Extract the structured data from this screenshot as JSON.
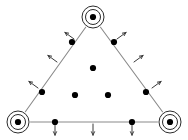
{
  "canvas": {
    "width": 188,
    "height": 140,
    "background": "#ffffff",
    "title": "Triangle lattice with corner orbifold points and outward boundary arrows"
  },
  "style": {
    "edge_color": "#8a8a8a",
    "edge_width": 1.1,
    "dot_color": "#000000",
    "dot_radius": 3.1,
    "ring_color": "#2b2b2b",
    "ring_width": 1.0,
    "arrow_color": "#3a3a3a",
    "arrow_width": 1.0,
    "arrow_length": 11
  },
  "chart_data": {
    "type": "scatter",
    "xlabel": "",
    "ylabel": "",
    "xlim": [
      0,
      188
    ],
    "ylim": [
      140,
      0
    ],
    "grid": false,
    "legend": "none",
    "series": [
      {
        "name": "corner-orbifold-points",
        "marker": "concentric-circles",
        "count": 3,
        "points": [
          {
            "label": "top-vertex",
            "x": 93,
            "y": 17
          },
          {
            "label": "bottom-left-vertex",
            "x": 18,
            "y": 122
          },
          {
            "label": "bottom-right-vertex",
            "x": 170,
            "y": 122
          }
        ]
      },
      {
        "name": "edge-points",
        "marker": "filled-dot",
        "count": 6,
        "points": [
          {
            "label": "left-edge-upper",
            "x": 72,
            "y": 42
          },
          {
            "label": "left-edge-lower",
            "x": 42,
            "y": 92
          },
          {
            "label": "right-edge-upper",
            "x": 114,
            "y": 42
          },
          {
            "label": "right-edge-lower",
            "x": 146,
            "y": 92
          },
          {
            "label": "bottom-edge-left",
            "x": 55,
            "y": 122
          },
          {
            "label": "bottom-edge-right",
            "x": 132,
            "y": 122
          }
        ]
      },
      {
        "name": "interior-points",
        "marker": "filled-dot",
        "count": 3,
        "points": [
          {
            "label": "interior-top",
            "x": 93,
            "y": 68
          },
          {
            "label": "interior-bottom-left",
            "x": 75,
            "y": 95
          },
          {
            "label": "interior-bottom-right",
            "x": 108,
            "y": 95
          }
        ]
      }
    ],
    "edges": [
      {
        "label": "left-edge",
        "x1": 93,
        "y1": 17,
        "x2": 18,
        "y2": 122
      },
      {
        "label": "right-edge",
        "x1": 93,
        "y1": 17,
        "x2": 170,
        "y2": 122
      },
      {
        "label": "bottom-edge",
        "x1": 18,
        "y1": 122,
        "x2": 170,
        "y2": 122
      }
    ],
    "arrows": [
      {
        "label": "left-edge-arrow-1",
        "x": 74,
        "y": 39,
        "dx": -0.81,
        "dy": -0.59
      },
      {
        "label": "left-edge-arrow-2",
        "x": 57,
        "y": 62,
        "dx": -0.81,
        "dy": -0.59
      },
      {
        "label": "left-edge-arrow-3",
        "x": 38,
        "y": 88,
        "dx": -0.81,
        "dy": -0.59
      },
      {
        "label": "right-edge-arrow-1",
        "x": 117,
        "y": 39,
        "dx": 0.81,
        "dy": -0.59
      },
      {
        "label": "right-edge-arrow-2",
        "x": 134,
        "y": 62,
        "dx": 0.81,
        "dy": -0.59
      },
      {
        "label": "right-edge-arrow-3",
        "x": 152,
        "y": 88,
        "dx": 0.81,
        "dy": -0.59
      },
      {
        "label": "bottom-edge-arrow-1",
        "x": 55,
        "y": 124,
        "dx": 0,
        "dy": 1
      },
      {
        "label": "bottom-edge-arrow-2",
        "x": 93,
        "y": 124,
        "dx": 0,
        "dy": 1
      },
      {
        "label": "bottom-edge-arrow-3",
        "x": 132,
        "y": 124,
        "dx": 0,
        "dy": 1
      }
    ],
    "orbifold_rings": [
      {
        "label": "top-vertex-rings",
        "cx": 93,
        "cy": 17,
        "radii": [
          7.5,
          11
        ]
      },
      {
        "label": "bottom-left-vertex-rings",
        "cx": 18,
        "cy": 122,
        "radii": [
          7.5,
          11
        ]
      },
      {
        "label": "bottom-right-vertex-rings",
        "cx": 170,
        "cy": 122,
        "radii": [
          7.5,
          11
        ]
      }
    ]
  }
}
